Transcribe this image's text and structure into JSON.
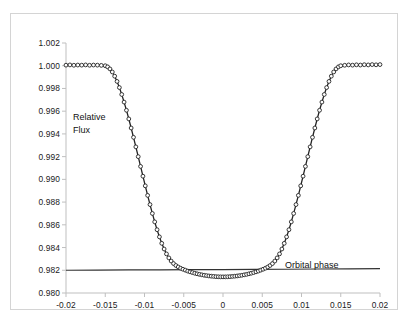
{
  "chart_data": {
    "type": "line",
    "title": "",
    "subtitle": "",
    "xlabel": "Orbital phase",
    "ylabel": "Relative Flux",
    "xlim": [
      -0.02,
      0.02
    ],
    "ylim": [
      0.98,
      1.002
    ],
    "grid": false,
    "legend_position": "none",
    "marker": "open-circle",
    "x_ticks": [
      -0.02,
      -0.015,
      -0.01,
      -0.005,
      0,
      0.005,
      0.01,
      0.015,
      0.02
    ],
    "x_tick_labels": [
      "-0.02",
      "-0.015",
      "-0.01",
      "-0.005",
      "0",
      "0.005",
      "0.01",
      "0.015",
      "0.02"
    ],
    "y_ticks": [
      0.98,
      0.982,
      0.984,
      0.986,
      0.988,
      0.99,
      0.992,
      0.994,
      0.996,
      0.998,
      1.0,
      1.002
    ],
    "y_tick_labels": [
      "0.980",
      "0.982",
      "0.984",
      "0.986",
      "0.988",
      "0.990",
      "0.992",
      "0.994",
      "0.996",
      "0.998",
      "1.000",
      "1.002"
    ],
    "annotations": [
      {
        "text": "Relative Flux",
        "x": -0.0165,
        "y": 0.9958
      },
      {
        "text": "Orbital phase",
        "x": 0.0085,
        "y": 0.9828
      }
    ],
    "series": [
      {
        "name": "transit-light-curve",
        "color": "#222222",
        "marker": "open-circle",
        "x": [
          -0.02,
          -0.0195,
          -0.019,
          -0.0185,
          -0.018,
          -0.0175,
          -0.017,
          -0.0165,
          -0.016,
          -0.0155,
          -0.015,
          -0.0147,
          -0.0144,
          -0.0141,
          -0.0138,
          -0.0135,
          -0.0132,
          -0.0129,
          -0.0126,
          -0.0123,
          -0.012,
          -0.0117,
          -0.0114,
          -0.0111,
          -0.0108,
          -0.0105,
          -0.0102,
          -0.0099,
          -0.0096,
          -0.0093,
          -0.009,
          -0.0087,
          -0.0084,
          -0.0081,
          -0.0078,
          -0.0075,
          -0.0072,
          -0.0069,
          -0.0066,
          -0.0063,
          -0.006,
          -0.0057,
          -0.0054,
          -0.0051,
          -0.0048,
          -0.0045,
          -0.0042,
          -0.0039,
          -0.0036,
          -0.0033,
          -0.003,
          -0.0027,
          -0.0024,
          -0.0021,
          -0.0018,
          -0.0015,
          -0.0012,
          -0.0009,
          -0.0006,
          -0.0003,
          0.0,
          0.0003,
          0.0006,
          0.0009,
          0.0012,
          0.0015,
          0.0018,
          0.0021,
          0.0024,
          0.0027,
          0.003,
          0.0033,
          0.0036,
          0.0039,
          0.0042,
          0.0045,
          0.0048,
          0.0051,
          0.0054,
          0.0057,
          0.006,
          0.0063,
          0.0066,
          0.0069,
          0.0072,
          0.0075,
          0.0078,
          0.0081,
          0.0084,
          0.0087,
          0.009,
          0.0093,
          0.0096,
          0.0099,
          0.0102,
          0.0105,
          0.0108,
          0.0111,
          0.0114,
          0.0117,
          0.012,
          0.0123,
          0.0126,
          0.0129,
          0.0132,
          0.0135,
          0.0138,
          0.0141,
          0.0144,
          0.0147,
          0.015,
          0.0155,
          0.016,
          0.0165,
          0.017,
          0.0175,
          0.018,
          0.0185,
          0.019,
          0.0195,
          0.02
        ],
        "y": [
          1.00005,
          1.00007,
          1.00004,
          1.00006,
          1.00005,
          1.00007,
          1.00004,
          1.00006,
          1.00005,
          1.00003,
          1.0,
          0.9999,
          0.99972,
          0.99945,
          0.99908,
          0.99862,
          0.99808,
          0.99747,
          0.9968,
          0.99608,
          0.99532,
          0.99452,
          0.9937,
          0.99286,
          0.992,
          0.99114,
          0.99028,
          0.98943,
          0.98859,
          0.98778,
          0.987,
          0.98626,
          0.98557,
          0.98494,
          0.98437,
          0.98387,
          0.98344,
          0.98309,
          0.98281,
          0.98259,
          0.98242,
          0.98229,
          0.98218,
          0.98209,
          0.98201,
          0.98193,
          0.98186,
          0.9818,
          0.98174,
          0.98169,
          0.98164,
          0.9816,
          0.98156,
          0.98153,
          0.9815,
          0.98148,
          0.98146,
          0.98144,
          0.98143,
          0.98142,
          0.98142,
          0.98142,
          0.98143,
          0.98144,
          0.98146,
          0.98148,
          0.9815,
          0.98153,
          0.98156,
          0.9816,
          0.98164,
          0.98169,
          0.98174,
          0.9818,
          0.98186,
          0.98193,
          0.98201,
          0.98209,
          0.98218,
          0.98229,
          0.98242,
          0.98259,
          0.98281,
          0.98309,
          0.98344,
          0.98387,
          0.98437,
          0.98494,
          0.98557,
          0.98626,
          0.987,
          0.98778,
          0.98859,
          0.98943,
          0.99028,
          0.99114,
          0.992,
          0.99286,
          0.9937,
          0.99452,
          0.99532,
          0.99608,
          0.9968,
          0.99747,
          0.99808,
          0.99862,
          0.99908,
          0.99945,
          0.99972,
          0.9999,
          1.0,
          1.00004,
          1.00007,
          1.00005,
          1.00008,
          1.00006,
          1.00009,
          1.00007,
          1.0001,
          1.00008,
          1.0001
        ]
      },
      {
        "name": "orbital-phase-baseline",
        "color": "#333333",
        "marker": "none",
        "x": [
          -0.02,
          -0.016,
          -0.012,
          -0.008,
          -0.004,
          0.0,
          0.004,
          0.008,
          0.012,
          0.016,
          0.02
        ],
        "y": [
          0.982,
          0.98202,
          0.98203,
          0.98204,
          0.98205,
          0.98206,
          0.98208,
          0.98209,
          0.98211,
          0.98213,
          0.98215
        ]
      }
    ]
  }
}
